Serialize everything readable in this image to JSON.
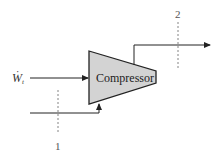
{
  "diagram": {
    "type": "compressor-control-volume",
    "component": {
      "label": "Compressor",
      "fill_color": "#d3d3d3",
      "stroke_color": "#222222"
    },
    "work_input": {
      "symbol": "W",
      "dot": "·",
      "subscript": "t",
      "direction": "into compressor"
    },
    "inlet": {
      "station_label": "1",
      "direction": "enters from bottom"
    },
    "outlet": {
      "station_label": "2",
      "direction": "exits to right from top"
    },
    "colors": {
      "line": "#222222",
      "dashed": "#666666",
      "background": "#ffffff"
    }
  }
}
